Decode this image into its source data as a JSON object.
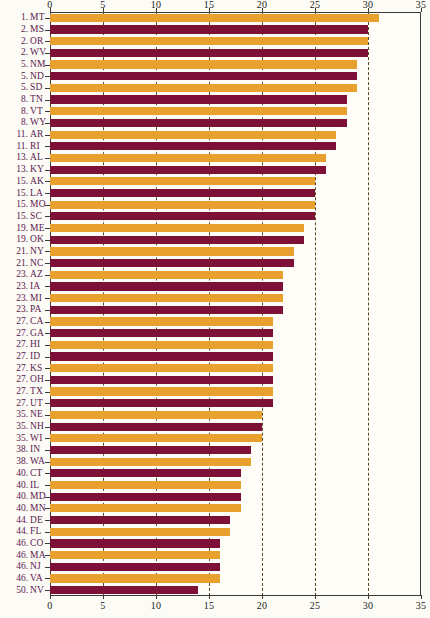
{
  "chart_data": {
    "type": "bar",
    "orientation": "horizontal",
    "title": "",
    "subtitle": "",
    "xlabel": "",
    "ylabel": "",
    "xlim": [
      0,
      35
    ],
    "xticks": [
      0,
      5,
      10,
      15,
      20,
      25,
      30,
      35
    ],
    "xtick_labels": [
      "0",
      "5",
      "10",
      "15",
      "20",
      "25",
      "30",
      "35"
    ],
    "grid": true,
    "grid_style": "dashed-vertical",
    "legend": "none",
    "axis_top_labels": true,
    "axis_bottom_labels": true,
    "colors": {
      "bar_alt_a": "#e8a02e",
      "bar_alt_b": "#7d1036",
      "label_text": "#5a2150",
      "tick_text": "#1b1b1b",
      "gridline": "#5a4a20",
      "axis": "#3a3a3a",
      "background": "#fdfbf6",
      "plot_background": "#fffdf8"
    },
    "categories": [
      "MT",
      "MS",
      "OR",
      "WV",
      "NM",
      "ND",
      "SD",
      "TN",
      "VT",
      "WY",
      "AR",
      "RI",
      "AL",
      "KY",
      "AK",
      "LA",
      "MO",
      "SC",
      "ME",
      "OK",
      "NY",
      "NC",
      "AZ",
      "IA",
      "MI",
      "PA",
      "CA",
      "GA",
      "HI",
      "ID",
      "KS",
      "OH",
      "TX",
      "UT",
      "NE",
      "NH",
      "WI",
      "IN",
      "WA",
      "CT",
      "IL",
      "MD",
      "MN",
      "DE",
      "FL",
      "CO",
      "MA",
      "NJ",
      "VA",
      "NV"
    ],
    "ranks": [
      "1.",
      "2.",
      "2.",
      "2.",
      "5.",
      "5.",
      "5.",
      "8.",
      "8.",
      "8.",
      "11.",
      "11.",
      "13.",
      "13.",
      "15.",
      "15.",
      "15.",
      "15.",
      "19.",
      "19.",
      "21.",
      "21.",
      "23.",
      "23.",
      "23.",
      "23.",
      "27.",
      "27.",
      "27.",
      "27.",
      "27.",
      "27.",
      "27.",
      "27.",
      "35.",
      "35.",
      "35.",
      "38.",
      "38.",
      "40.",
      "40.",
      "40.",
      "40.",
      "44.",
      "44.",
      "46.",
      "46.",
      "46.",
      "46.",
      "50."
    ],
    "values": [
      31,
      30,
      30,
      30,
      29,
      29,
      29,
      28,
      28,
      28,
      27,
      27,
      26,
      26,
      25,
      25,
      25,
      25,
      24,
      24,
      23,
      23,
      22,
      22,
      22,
      22,
      21,
      21,
      21,
      21,
      21,
      21,
      21,
      21,
      20,
      20,
      20,
      19,
      19,
      18,
      18,
      18,
      18,
      17,
      17,
      16,
      16,
      16,
      16,
      14
    ],
    "bar_colors": [
      "#e8a02e",
      "#7d1036",
      "#e8a02e",
      "#7d1036",
      "#e8a02e",
      "#7d1036",
      "#e8a02e",
      "#7d1036",
      "#e8a02e",
      "#7d1036",
      "#e8a02e",
      "#7d1036",
      "#e8a02e",
      "#7d1036",
      "#e8a02e",
      "#7d1036",
      "#e8a02e",
      "#7d1036",
      "#e8a02e",
      "#7d1036",
      "#e8a02e",
      "#7d1036",
      "#e8a02e",
      "#7d1036",
      "#e8a02e",
      "#7d1036",
      "#e8a02e",
      "#7d1036",
      "#e8a02e",
      "#7d1036",
      "#e8a02e",
      "#7d1036",
      "#e8a02e",
      "#7d1036",
      "#e8a02e",
      "#7d1036",
      "#e8a02e",
      "#7d1036",
      "#e8a02e",
      "#7d1036",
      "#e8a02e",
      "#7d1036",
      "#e8a02e",
      "#7d1036",
      "#e8a02e",
      "#7d1036",
      "#e8a02e",
      "#7d1036",
      "#e8a02e",
      "#7d1036"
    ]
  }
}
